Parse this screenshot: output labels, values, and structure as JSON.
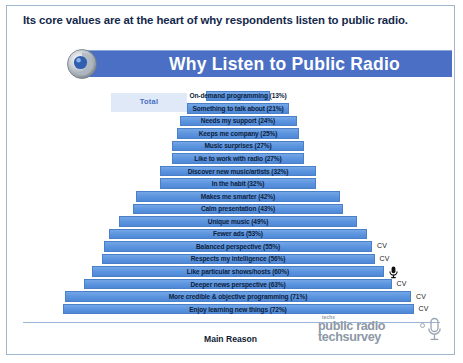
{
  "headline": "Its core values are at the heart of why respondents listen to public radio.",
  "banner": {
    "title": "Why Listen to Public Radio",
    "logo_icon": "swirl-circle-icon",
    "bg_color": "#4a6fc4"
  },
  "legend": {
    "label": "Total",
    "swatch_color": "#dfe9f7",
    "text_color": "#4a6fc4"
  },
  "axis": {
    "title": "Main Reason"
  },
  "brand": {
    "kicker": "techs",
    "line1": "public radio",
    "line2": "techsurvey",
    "mic_icon": "microphone-icon"
  },
  "annotations": {
    "cv_label": "CV",
    "mic_marker_icon": "microphone-marker-icon"
  },
  "chart_data": {
    "type": "bar",
    "orientation": "horizontal-centered-pyramid",
    "title": "Why Listen to Public Radio",
    "xlabel": "Main Reason",
    "ylabel": "",
    "ylim": [
      0,
      80
    ],
    "grid": false,
    "legend_position": "top-left",
    "series_name": "Total",
    "bar_color": "#5d96e0",
    "categories": [
      "On-demand programming",
      "Something to talk about",
      "Needs my support",
      "Keeps me company",
      "Music surprises",
      "Like to work with radio",
      "Discover new music/artists",
      "In the habit",
      "Makes me smarter",
      "Calm presentation",
      "Unique music",
      "Fewer ads",
      "Balanced perspective",
      "Respects my intelligence",
      "Like particular shows/hosts",
      "Deeper news perspective",
      "More credible & objective programming",
      "Enjoy learning new things"
    ],
    "values": [
      13,
      21,
      24,
      25,
      27,
      27,
      32,
      32,
      42,
      43,
      49,
      53,
      55,
      56,
      60,
      63,
      71,
      72
    ],
    "data_labels": [
      "On-demand programming (13%)",
      "Something to talk about (21%)",
      "Needs my support (24%)",
      "Keeps me company (25%)",
      "Music surprises (27%)",
      "Like to work with radio (27%)",
      "Discover new music/artists (32%)",
      "In the habit (32%)",
      "Makes me smarter (42%)",
      "Calm presentation (43%)",
      "Unique music (49%)",
      "Fewer ads (53%)",
      "Balanced perspective (55%)",
      "Respects my intelligence (56%)",
      "Like particular shows/hosts (60%)",
      "Deeper news perspective (63%)",
      "More credible & objective programming (71%)",
      "Enjoy learning new things (72%)"
    ],
    "cv_flags": [
      false,
      false,
      false,
      false,
      false,
      false,
      false,
      false,
      false,
      false,
      false,
      false,
      true,
      true,
      false,
      true,
      true,
      true
    ],
    "mic_marker_index": 14
  }
}
